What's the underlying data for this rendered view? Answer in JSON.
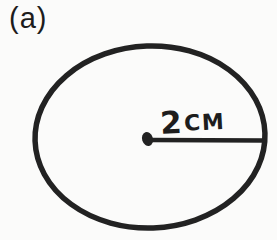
{
  "figure": {
    "part_label": "(a)",
    "shape": "circle",
    "radius_value": "2",
    "radius_unit": "cm",
    "radius_label": "2cm",
    "colors": {
      "ink": "#222222",
      "background": "#fbfbfa"
    }
  }
}
